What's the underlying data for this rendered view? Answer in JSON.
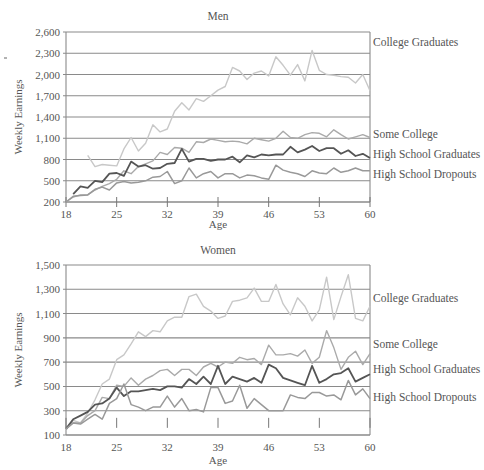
{
  "chart_data": [
    {
      "type": "line",
      "title": "Men",
      "xlabel": "Age",
      "ylabel": "Weekly Earnings",
      "xlim": [
        18,
        60
      ],
      "ylim": [
        200,
        2600
      ],
      "x_ticks": [
        18,
        25,
        32,
        39,
        46,
        53,
        60
      ],
      "y_ticks": [
        200,
        500,
        800,
        1100,
        1400,
        1700,
        2000,
        2300,
        2600
      ],
      "y_tick_labels": [
        "200",
        "500",
        "800",
        "1,100",
        "1,400",
        "1,700",
        "2,000",
        "2,300",
        "2,600"
      ],
      "grid": true,
      "legend_position": "right, inline labels",
      "x": [
        18,
        19,
        20,
        21,
        22,
        23,
        24,
        25,
        26,
        27,
        28,
        29,
        30,
        31,
        32,
        33,
        34,
        35,
        36,
        37,
        38,
        39,
        40,
        41,
        42,
        43,
        44,
        45,
        46,
        47,
        48,
        49,
        50,
        51,
        52,
        53,
        54,
        55,
        56,
        57,
        58,
        59,
        60
      ],
      "series": [
        {
          "name": "College Graduates",
          "color": "#c8c8c8",
          "width": 1.4,
          "values": [
            null,
            null,
            null,
            860,
            700,
            730,
            720,
            710,
            950,
            1110,
            920,
            1030,
            1290,
            1190,
            1230,
            1480,
            1600,
            1500,
            1660,
            1620,
            1700,
            1780,
            1830,
            2100,
            2050,
            1930,
            2020,
            2050,
            1980,
            2250,
            2130,
            1990,
            2140,
            1910,
            2340,
            2060,
            2000,
            1990,
            1970,
            1960,
            1880,
            2000,
            1770
          ]
        },
        {
          "name": "Some College",
          "color": "#aaaaaa",
          "width": 1.4,
          "values": [
            200,
            270,
            300,
            300,
            370,
            420,
            460,
            520,
            640,
            600,
            700,
            740,
            780,
            900,
            870,
            970,
            960,
            900,
            1050,
            1040,
            1090,
            1070,
            1050,
            1060,
            1050,
            1020,
            1100,
            1080,
            1060,
            1100,
            1200,
            1110,
            1100,
            1150,
            1180,
            1170,
            1120,
            1220,
            1150,
            1090,
            1120,
            1150,
            1110
          ]
        },
        {
          "name": "High School Graduates",
          "color": "#555555",
          "width": 1.8,
          "values": [
            null,
            310,
            420,
            400,
            500,
            480,
            600,
            610,
            570,
            770,
            700,
            720,
            670,
            680,
            740,
            750,
            950,
            770,
            810,
            810,
            780,
            800,
            800,
            840,
            760,
            860,
            830,
            870,
            860,
            870,
            870,
            980,
            900,
            940,
            990,
            920,
            960,
            960,
            880,
            930,
            850,
            880,
            820
          ]
        },
        {
          "name": "High School Dropouts",
          "color": "#999999",
          "width": 1.5,
          "values": [
            200,
            280,
            290,
            300,
            380,
            410,
            370,
            470,
            490,
            470,
            480,
            500,
            550,
            560,
            630,
            460,
            500,
            680,
            540,
            600,
            630,
            540,
            600,
            600,
            540,
            580,
            570,
            540,
            520,
            720,
            650,
            620,
            600,
            560,
            640,
            610,
            600,
            680,
            620,
            640,
            680,
            640,
            640
          ]
        }
      ]
    },
    {
      "type": "line",
      "title": "Women",
      "xlabel": "Age",
      "ylabel": "Weekly Earnings",
      "xlim": [
        18,
        60
      ],
      "ylim": [
        100,
        1500
      ],
      "x_ticks": [
        18,
        25,
        32,
        39,
        46,
        53,
        60
      ],
      "y_ticks": [
        100,
        300,
        500,
        700,
        900,
        1100,
        1300,
        1500
      ],
      "y_tick_labels": [
        "100",
        "300",
        "500",
        "700",
        "900",
        "1,100",
        "1,300",
        "1,500"
      ],
      "grid": true,
      "legend_position": "right, inline labels",
      "x": [
        18,
        19,
        20,
        21,
        22,
        23,
        24,
        25,
        26,
        27,
        28,
        29,
        30,
        31,
        32,
        33,
        34,
        35,
        36,
        37,
        38,
        39,
        40,
        41,
        42,
        43,
        44,
        45,
        46,
        47,
        48,
        49,
        50,
        51,
        52,
        53,
        54,
        55,
        56,
        57,
        58,
        59,
        60
      ],
      "series": [
        {
          "name": "College Graduates",
          "color": "#c8c8c8",
          "width": 1.4,
          "values": [
            140,
            220,
            200,
            280,
            390,
            520,
            560,
            720,
            760,
            850,
            950,
            910,
            960,
            950,
            1040,
            1070,
            1070,
            1240,
            1260,
            1160,
            1120,
            1060,
            1080,
            1200,
            1210,
            1230,
            1310,
            1200,
            1200,
            1340,
            1180,
            1090,
            1230,
            1160,
            1040,
            1130,
            1400,
            1050,
            1240,
            1420,
            1060,
            1040,
            1160
          ]
        },
        {
          "name": "Some College",
          "color": "#aaaaaa",
          "width": 1.4,
          "values": [
            150,
            200,
            200,
            260,
            300,
            410,
            400,
            510,
            500,
            570,
            510,
            560,
            590,
            630,
            640,
            590,
            640,
            640,
            590,
            660,
            690,
            660,
            700,
            690,
            740,
            720,
            730,
            680,
            840,
            760,
            760,
            770,
            750,
            800,
            690,
            740,
            960,
            820,
            640,
            740,
            790,
            680,
            770
          ]
        },
        {
          "name": "High School Graduates",
          "color": "#555555",
          "width": 1.8,
          "values": [
            150,
            230,
            260,
            290,
            350,
            360,
            400,
            490,
            420,
            460,
            460,
            470,
            480,
            470,
            500,
            500,
            490,
            560,
            520,
            580,
            520,
            670,
            520,
            580,
            560,
            540,
            570,
            530,
            680,
            650,
            570,
            550,
            530,
            510,
            670,
            530,
            560,
            600,
            610,
            650,
            540,
            570,
            600
          ]
        },
        {
          "name": "High School Dropouts",
          "color": "#999999",
          "width": 1.5,
          "values": [
            150,
            200,
            190,
            230,
            270,
            230,
            360,
            400,
            520,
            350,
            330,
            300,
            330,
            330,
            420,
            330,
            400,
            300,
            310,
            290,
            490,
            490,
            360,
            380,
            510,
            320,
            400,
            350,
            300,
            300,
            300,
            430,
            410,
            400,
            450,
            450,
            420,
            430,
            390,
            550,
            430,
            480,
            400
          ]
        }
      ]
    }
  ],
  "layout": {
    "charts": [
      {
        "plot": {
          "left": 66,
          "right": 370,
          "top": 32,
          "bottom": 202
        },
        "title_y": 20,
        "age_label_y": 228
      },
      {
        "plot": {
          "left": 66,
          "right": 370,
          "top": 265,
          "bottom": 435
        },
        "title_y": 254,
        "age_label_y": 464
      }
    ]
  }
}
